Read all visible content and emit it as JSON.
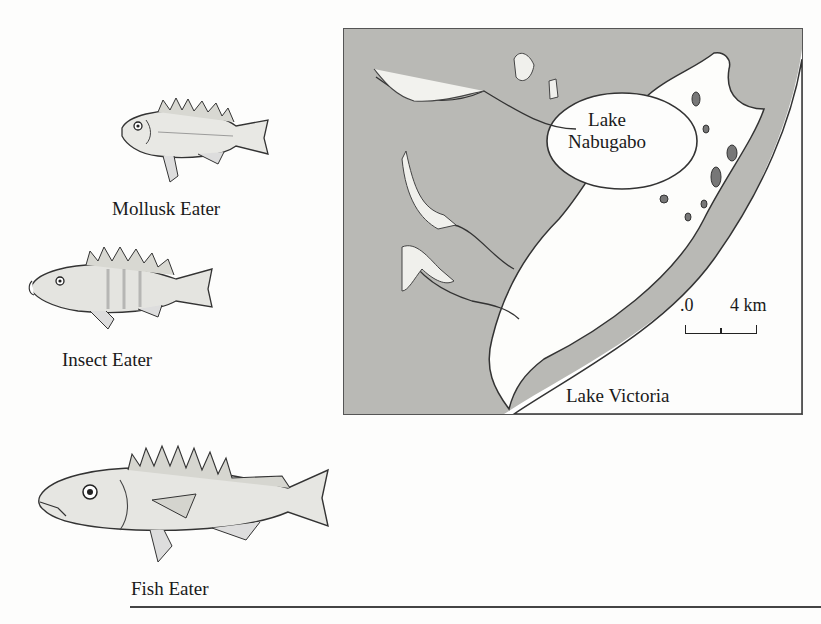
{
  "fish": [
    {
      "name": "mollusk",
      "label": "Mollusk Eater"
    },
    {
      "name": "insect",
      "label": "Insect Eater"
    },
    {
      "name": "fish",
      "label": "Fish Eater"
    }
  ],
  "map": {
    "lake_nabugabo_line1": "Lake",
    "lake_nabugabo_line2": "Nabugabo",
    "lake_victoria": "Lake Victoria",
    "scale": {
      "start": ".0",
      "end": "4 km"
    }
  },
  "colors": {
    "land": "#b8b8b4",
    "water": "#ffffff",
    "swamp": "#ffffff",
    "outline": "#333333"
  }
}
